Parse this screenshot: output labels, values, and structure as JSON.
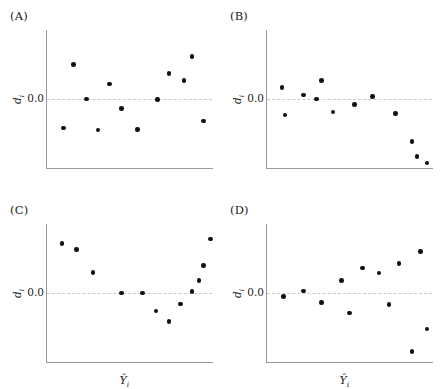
{
  "figure": {
    "axis_label_y": "d",
    "axis_label_y_sub": "i",
    "axis_zero_tick": "0.0",
    "axis_label_x": "Y",
    "axis_label_x_sub": "i",
    "point_color": "#111111",
    "axis_color": "#9a9a9a",
    "zeroline_color": "#c9c9c9",
    "background": "#ffffff"
  },
  "panels": [
    {
      "label": "(A)",
      "left": 0,
      "top": 0,
      "show_xlabel": false
    },
    {
      "label": "(B)",
      "left": 220,
      "top": 0,
      "show_xlabel": false
    },
    {
      "label": "(C)",
      "left": 0,
      "top": 194,
      "show_xlabel": true
    },
    {
      "label": "(D)",
      "left": 220,
      "top": 194,
      "show_xlabel": true
    }
  ],
  "chart_data": [
    {
      "type": "scatter",
      "title": "(A)",
      "pattern": "random scatter about zero — no systematic trend",
      "xlabel": "Y-hat i",
      "ylabel": "d i",
      "ylim": [
        -1,
        1
      ],
      "xlim": [
        0,
        1
      ],
      "zero_reference": 0.0,
      "x": [
        0.1,
        0.16,
        0.24,
        0.31,
        0.38,
        0.45,
        0.55,
        0.67,
        0.74,
        0.83,
        0.88,
        0.95
      ],
      "y": [
        -0.42,
        0.5,
        0.0,
        -0.45,
        0.22,
        -0.14,
        -0.44,
        -0.01,
        0.37,
        0.27,
        0.62,
        -0.32
      ]
    },
    {
      "type": "scatter",
      "title": "(B)",
      "pattern": "flat near zero then sharp downward drop at high fitted values",
      "xlabel": "Y-hat i",
      "ylabel": "d i",
      "ylim": [
        -1,
        1
      ],
      "xlim": [
        0,
        1
      ],
      "zero_reference": 0.0,
      "x": [
        0.09,
        0.11,
        0.22,
        0.3,
        0.33,
        0.4,
        0.53,
        0.64,
        0.78,
        0.88,
        0.91,
        0.97
      ],
      "y": [
        0.17,
        -0.23,
        0.06,
        0.0,
        0.27,
        -0.19,
        -0.08,
        0.04,
        -0.21,
        -0.62,
        -0.83,
        -0.93
      ]
    },
    {
      "type": "scatter",
      "title": "(C)",
      "pattern": "U-shaped curvature — systematic quadratic departure",
      "xlabel": "Y-hat i",
      "ylabel": "d i",
      "ylim": [
        -1,
        1
      ],
      "xlim": [
        0,
        1
      ],
      "zero_reference": 0.0,
      "x": [
        0.09,
        0.18,
        0.28,
        0.45,
        0.58,
        0.66,
        0.74,
        0.81,
        0.88,
        0.92,
        0.95,
        0.99
      ],
      "y": [
        0.72,
        0.63,
        0.3,
        0.0,
        0.0,
        -0.26,
        -0.41,
        -0.16,
        0.02,
        0.18,
        0.4,
        0.78
      ]
    },
    {
      "type": "scatter",
      "title": "(D)",
      "pattern": "fanning / megaphone spread — increasing variance (heteroscedasticity)",
      "xlabel": "Y-hat i",
      "ylabel": "d i",
      "ylim": [
        -1,
        1
      ],
      "xlim": [
        0,
        1
      ],
      "zero_reference": 0.0,
      "x": [
        0.1,
        0.22,
        0.33,
        0.45,
        0.5,
        0.58,
        0.68,
        0.74,
        0.8,
        0.88,
        0.93,
        0.97
      ],
      "y": [
        -0.05,
        0.03,
        -0.14,
        0.18,
        -0.29,
        0.36,
        0.29,
        -0.17,
        0.43,
        -0.85,
        0.6,
        -0.52
      ]
    }
  ]
}
